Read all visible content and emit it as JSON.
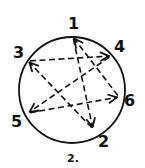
{
  "diagram": {
    "type": "directed-cycle-on-circle",
    "circle": {
      "cx": 72,
      "cy": 90,
      "r": 53
    },
    "stroke_color": "#111111",
    "background": "#ffffff",
    "nodes": [
      {
        "id": "1",
        "label": "1",
        "x": 73,
        "y": 37,
        "label_x": 68,
        "label_y": 29
      },
      {
        "id": "4",
        "label": "4",
        "x": 111,
        "y": 56,
        "label_x": 114,
        "label_y": 52
      },
      {
        "id": "3",
        "label": "3",
        "x": 28,
        "y": 61,
        "label_x": 13,
        "label_y": 58
      },
      {
        "id": "6",
        "label": "6",
        "x": 119,
        "y": 97,
        "label_x": 124,
        "label_y": 106
      },
      {
        "id": "5",
        "label": "5",
        "x": 28,
        "y": 113,
        "label_x": 11,
        "label_y": 127
      },
      {
        "id": "2",
        "label": "2",
        "x": 93,
        "y": 129,
        "label_x": 98,
        "label_y": 147
      }
    ],
    "edges": [
      {
        "from": "1",
        "to": "2",
        "style": "dashed-arrow"
      },
      {
        "from": "2",
        "to": "3",
        "style": "dashed-arrow"
      },
      {
        "from": "3",
        "to": "4",
        "style": "dashed-arrow"
      },
      {
        "from": "4",
        "to": "5",
        "style": "dashed-arrow"
      },
      {
        "from": "5",
        "to": "6",
        "style": "dashed-arrow"
      },
      {
        "from": "6",
        "to": "1",
        "style": "dashed-arrow"
      }
    ],
    "caption": "2.",
    "caption_x": 67,
    "caption_y": 162
  }
}
